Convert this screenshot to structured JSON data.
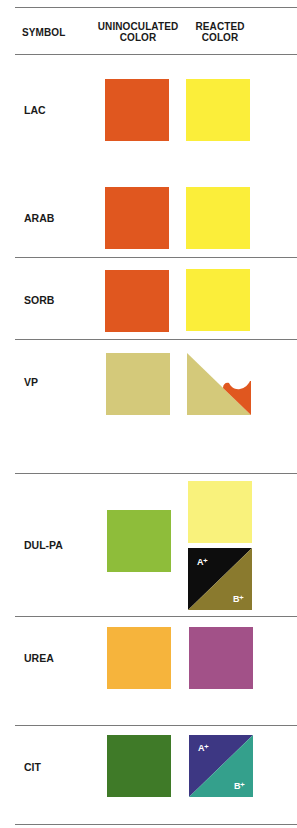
{
  "header": {
    "symbol": "SYMBOL",
    "uninoculated_line1": "UNINOCULATED",
    "uninoculated_line2": "COLOR",
    "reacted_line1": "REACTED",
    "reacted_line2": "COLOR"
  },
  "colors": {
    "orange_red": "#e0571f",
    "yellow": "#fbee3a",
    "tan": "#d4c97a",
    "lime_green": "#8ebd3a",
    "pale_yellow": "#f9f27c",
    "black": "#0d0d0d",
    "olive": "#8a7a2e",
    "amber": "#f6b43c",
    "magenta_purple": "#a25188",
    "dark_green": "#3f7a28",
    "indigo": "#3d3783",
    "teal": "#34a08c",
    "rule": "#7a7a7a"
  },
  "rows": [
    {
      "symbol": "LAC",
      "uninoculated": "orange-red",
      "reacted": "yellow"
    },
    {
      "symbol": "ARAB",
      "uninoculated": "orange-red",
      "reacted": "yellow"
    },
    {
      "symbol": "SORB",
      "uninoculated": "orange-red",
      "reacted": "yellow"
    },
    {
      "symbol": "VP",
      "uninoculated": "tan",
      "reacted": "tan with orange-red lower-right wedge"
    },
    {
      "symbol": "DUL-PA",
      "uninoculated": "lime green",
      "reacted": [
        "pale yellow",
        "split black / olive"
      ],
      "reacted_labels": [
        "A⁺",
        "B⁺"
      ]
    },
    {
      "symbol": "UREA",
      "uninoculated": "amber",
      "reacted": "magenta-purple"
    },
    {
      "symbol": "CIT",
      "uninoculated": "dark green",
      "reacted": "split indigo / teal",
      "reacted_labels": [
        "A⁺",
        "B⁺"
      ]
    }
  ]
}
